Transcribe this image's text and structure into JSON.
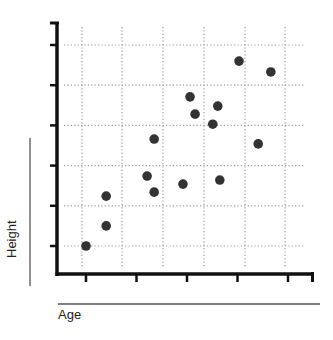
{
  "chart_data": {
    "type": "scatter",
    "title": "",
    "xlabel": "Age",
    "ylabel": "Height",
    "x_ticks": [
      "",
      "",
      "",
      "",
      ""
    ],
    "y_ticks": [
      "",
      "",
      "",
      "",
      "",
      ""
    ],
    "xlim": [
      0.4,
      5.5
    ],
    "ylim": [
      0.3,
      6.4
    ],
    "grid": true,
    "grid_style": "dotted",
    "legend": null,
    "series": [
      {
        "name": "points",
        "color": "#333333",
        "points": [
          {
            "x": 1.0,
            "y": 1.0
          },
          {
            "x": 1.4,
            "y": 1.5
          },
          {
            "x": 1.4,
            "y": 2.24
          },
          {
            "x": 2.21,
            "y": 2.74
          },
          {
            "x": 2.35,
            "y": 2.34
          },
          {
            "x": 2.35,
            "y": 3.66
          },
          {
            "x": 2.92,
            "y": 2.54
          },
          {
            "x": 3.65,
            "y": 2.64
          },
          {
            "x": 3.06,
            "y": 4.71
          },
          {
            "x": 3.16,
            "y": 4.28
          },
          {
            "x": 3.61,
            "y": 4.48
          },
          {
            "x": 3.51,
            "y": 4.03
          },
          {
            "x": 4.41,
            "y": 3.54
          },
          {
            "x": 4.03,
            "y": 5.6
          },
          {
            "x": 4.66,
            "y": 5.33
          }
        ]
      }
    ]
  },
  "labels": {
    "x_axis": "Age",
    "y_axis": "Height"
  },
  "colors": {
    "axis": "#111111",
    "grid": "#999999",
    "point": "#333333",
    "label_rule": "#555555"
  }
}
